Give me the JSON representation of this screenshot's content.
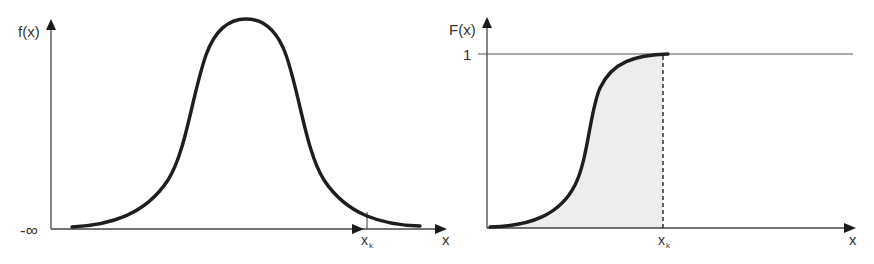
{
  "left_chart": {
    "y_label": "f(x)",
    "x_label": "x",
    "x_min_label": "-∞",
    "marker_label": "x",
    "marker_subscript": "k",
    "description": "Bell-shaped probability density curve"
  },
  "right_chart": {
    "y_label": "F(x)",
    "x_label": "x",
    "y_tick_label": "1",
    "marker_label": "x",
    "marker_subscript": "k",
    "description": "S-shaped cumulative distribution curve with shaded area up to x_k"
  },
  "colors": {
    "curve": "#1e1e1e",
    "axis": "#444444",
    "shade": "#ededed"
  }
}
